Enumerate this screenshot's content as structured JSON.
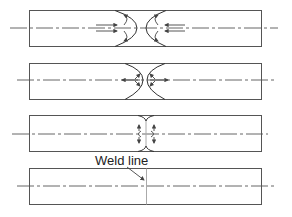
{
  "figure": {
    "stages": [
      {
        "id": 1,
        "description": "Two melt fronts approaching each other with fountain flow"
      },
      {
        "id": 2,
        "description": "Melt fronts meeting at center"
      },
      {
        "id": 3,
        "description": "Fronts merging, flow diverting outward"
      },
      {
        "id": 4,
        "description": "Completed fill with weld line"
      }
    ],
    "annotation": {
      "label": "Weld line"
    },
    "colors": {
      "outline": "#555555",
      "weld_line": "#aaaaaa",
      "background": "#ffffff"
    }
  }
}
